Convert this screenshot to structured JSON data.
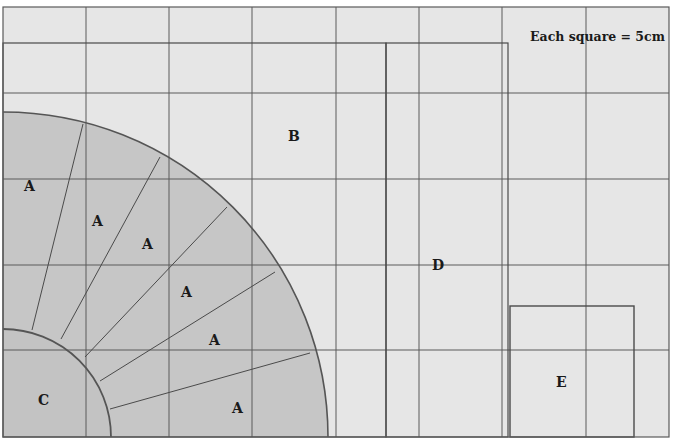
{
  "diagram": {
    "title": "Each square = 5cm",
    "scale_note": "Each square = 5cm",
    "grid": {
      "square_size_cm": 5,
      "columns": 8,
      "rows": 5,
      "vertical_lines_px": [
        3,
        86,
        169,
        252,
        336,
        419,
        502,
        586,
        669
      ],
      "horizontal_lines_px": [
        7,
        93,
        179,
        265,
        350,
        437
      ]
    },
    "colors": {
      "background": "#e6e6e6",
      "grid_line": "#5a5a5a",
      "shape_fill": "#c6c6c6",
      "outline": "#4a4a4a",
      "text": "#1a1a1a"
    },
    "shapes": {
      "A": {
        "label": "A",
        "type": "annular-sector-pieces",
        "count": 6
      },
      "B": {
        "label": "B",
        "type": "rectangle"
      },
      "C": {
        "label": "C",
        "type": "quarter-circle"
      },
      "D": {
        "label": "D",
        "type": "rectangle"
      },
      "E": {
        "label": "E",
        "type": "square"
      }
    },
    "labels": {
      "a1": "A",
      "a2": "A",
      "a3": "A",
      "a4": "A",
      "a5": "A",
      "a6": "A",
      "b": "B",
      "c": "C",
      "d": "D",
      "e": "E"
    }
  }
}
